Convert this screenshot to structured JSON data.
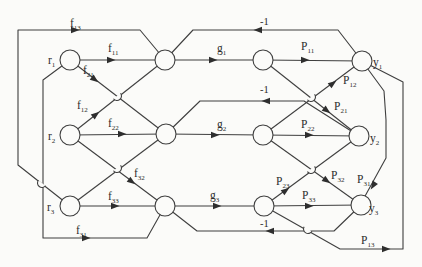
{
  "diagram": {
    "type": "signal-flow-graph",
    "background": "#fbfbf9",
    "line_color": "#3f3f3f",
    "nodes": [
      {
        "id": "r1",
        "role": "input"
      },
      {
        "id": "r2",
        "role": "input"
      },
      {
        "id": "r3",
        "role": "input"
      },
      {
        "id": "s1",
        "role": "summing"
      },
      {
        "id": "s2",
        "role": "summing"
      },
      {
        "id": "s3",
        "role": "summing"
      },
      {
        "id": "t1",
        "role": "internal"
      },
      {
        "id": "t2",
        "role": "internal"
      },
      {
        "id": "t3",
        "role": "internal"
      },
      {
        "id": "y1",
        "role": "output"
      },
      {
        "id": "y2",
        "role": "output"
      },
      {
        "id": "y3",
        "role": "output"
      }
    ],
    "edges": [
      {
        "from": "r1",
        "to": "s1",
        "label": "f11"
      },
      {
        "from": "r1",
        "to": "s2",
        "label": "f21"
      },
      {
        "from": "r1",
        "to": "s3",
        "label": "f31"
      },
      {
        "from": "r2",
        "to": "s1",
        "label": "f12"
      },
      {
        "from": "r2",
        "to": "s2",
        "label": "f22"
      },
      {
        "from": "r2",
        "to": "s3",
        "label": "f32"
      },
      {
        "from": "r3",
        "to": "s1",
        "label": "f13"
      },
      {
        "from": "r3",
        "to": "s2",
        "label": ""
      },
      {
        "from": "r3",
        "to": "s3",
        "label": "f33"
      },
      {
        "from": "s1",
        "to": "t1",
        "label": "g1"
      },
      {
        "from": "s2",
        "to": "t2",
        "label": "g2"
      },
      {
        "from": "s3",
        "to": "t3",
        "label": "g3"
      },
      {
        "from": "t1",
        "to": "y1",
        "label": "P11"
      },
      {
        "from": "t1",
        "to": "y2",
        "label": "P21"
      },
      {
        "from": "t2",
        "to": "y1",
        "label": "P12"
      },
      {
        "from": "t2",
        "to": "y2",
        "label": "P22"
      },
      {
        "from": "t2",
        "to": "y3",
        "label": "P32"
      },
      {
        "from": "t3",
        "to": "y2",
        "label": "P23"
      },
      {
        "from": "t3",
        "to": "y3",
        "label": "P33"
      },
      {
        "from": "t3",
        "to": "y1",
        "label": "P13"
      },
      {
        "from": "y1",
        "to": "y3",
        "label": "P31"
      },
      {
        "from": "y1",
        "to": "s1",
        "label": "-1"
      },
      {
        "from": "y2",
        "to": "s2",
        "label": "-1"
      },
      {
        "from": "y3",
        "to": "s3",
        "label": "-1"
      }
    ],
    "labels": {
      "f11": {
        "base": "f",
        "sub": "11"
      },
      "f12": {
        "base": "f",
        "sub": "12"
      },
      "f13": {
        "base": "f",
        "sub": "13"
      },
      "f21": {
        "base": "f",
        "sub": "21"
      },
      "f22": {
        "base": "f",
        "sub": "22"
      },
      "f31": {
        "base": "f",
        "sub": "31"
      },
      "f32": {
        "base": "f",
        "sub": "32"
      },
      "f33": {
        "base": "f",
        "sub": "33"
      },
      "g1": {
        "base": "g",
        "sub": "1"
      },
      "g2": {
        "base": "g",
        "sub": "2"
      },
      "g3": {
        "base": "g",
        "sub": "3"
      },
      "p11": {
        "base": "P",
        "sub": "11"
      },
      "p12": {
        "base": "P",
        "sub": "12"
      },
      "p13": {
        "base": "P",
        "sub": "13"
      },
      "p21": {
        "base": "P",
        "sub": "21"
      },
      "p22": {
        "base": "P",
        "sub": "22"
      },
      "p23": {
        "base": "P",
        "sub": "23"
      },
      "p31": {
        "base": "P",
        "sub": "31"
      },
      "p32": {
        "base": "P",
        "sub": "32"
      },
      "p33": {
        "base": "P",
        "sub": "33"
      },
      "r1": {
        "base": "r",
        "sub": "1"
      },
      "r2": {
        "base": "r",
        "sub": "2"
      },
      "r3": {
        "base": "r",
        "sub": "3"
      },
      "y1": {
        "base": "y",
        "sub": "1"
      },
      "y2": {
        "base": "y",
        "sub": "2"
      },
      "y3": {
        "base": "y",
        "sub": "3"
      },
      "minus1_top": "-1",
      "minus1_mid": "-1",
      "minus1_bot": "-1"
    }
  }
}
